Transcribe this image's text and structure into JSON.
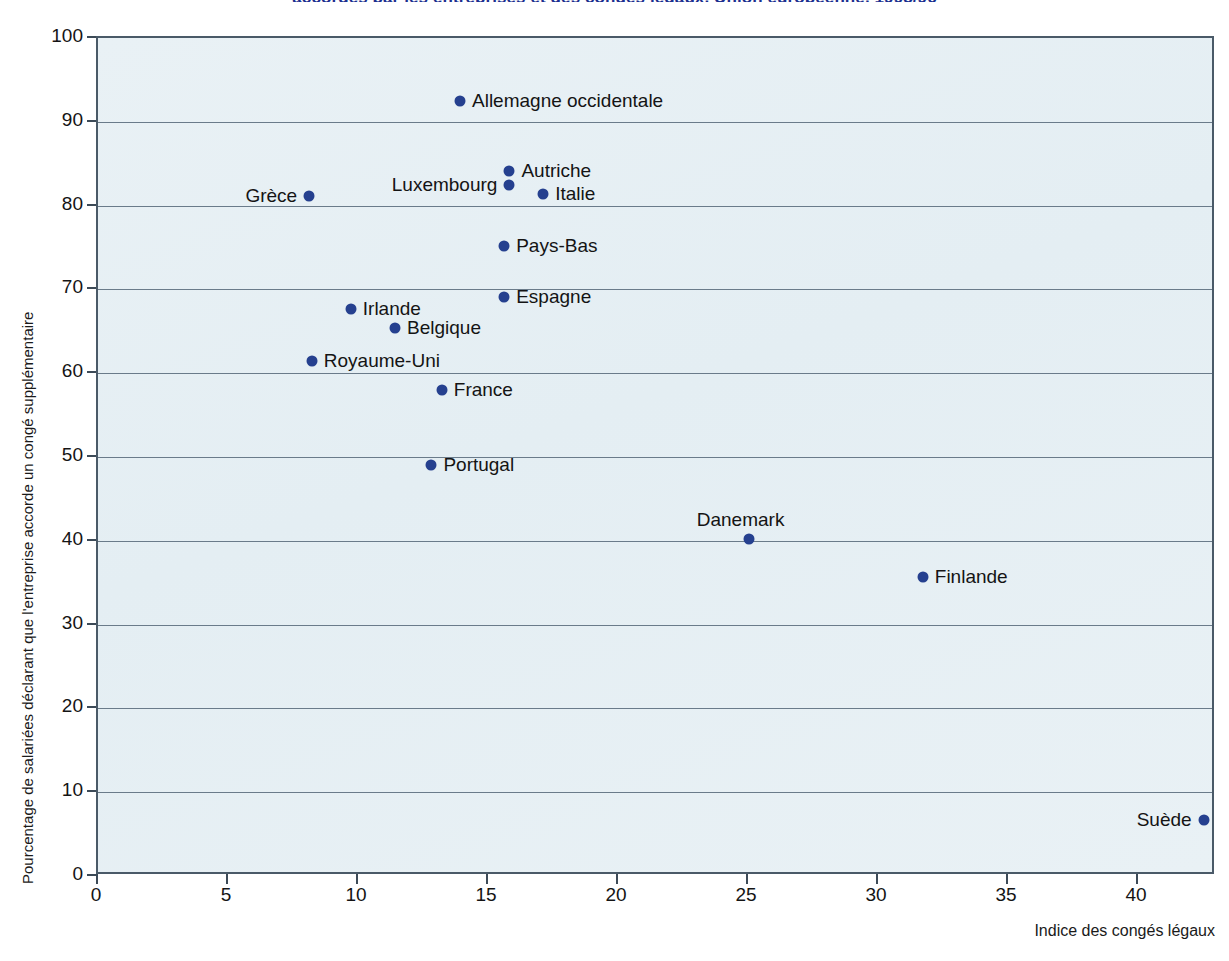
{
  "chart_data": {
    "type": "scatter",
    "title": "accordés par les entreprises et des congés légaux, Union européenne, 1995/96",
    "xlabel": "Indice des congés légaux",
    "ylabel": "Pourcentage de salariées déclarant que l'entreprise accorde un congé supplémentaire",
    "xlim": [
      0,
      43
    ],
    "ylim": [
      0,
      100
    ],
    "xticks": [
      0,
      5,
      10,
      15,
      20,
      25,
      30,
      35,
      40
    ],
    "yticks": [
      0,
      10,
      20,
      30,
      40,
      50,
      60,
      70,
      80,
      90,
      100
    ],
    "grid": "horizontal",
    "legend": "none",
    "marker_color": "#25408f",
    "plot_background": "#e8f0f4",
    "points": [
      {
        "label": "Allemagne occidentale",
        "x": 14.0,
        "y": 92.2,
        "label_side": "right"
      },
      {
        "label": "Autriche",
        "x": 15.9,
        "y": 83.9,
        "label_side": "right"
      },
      {
        "label": "Luxembourg",
        "x": 15.9,
        "y": 82.2,
        "label_side": "left"
      },
      {
        "label": "Italie",
        "x": 17.2,
        "y": 81.1,
        "label_side": "right"
      },
      {
        "label": "Grèce",
        "x": 8.2,
        "y": 80.9,
        "label_side": "left"
      },
      {
        "label": "Pays-Bas",
        "x": 15.7,
        "y": 75.0,
        "label_side": "right"
      },
      {
        "label": "Espagne",
        "x": 15.7,
        "y": 68.9,
        "label_side": "right"
      },
      {
        "label": "Irlande",
        "x": 9.8,
        "y": 67.4,
        "label_side": "right"
      },
      {
        "label": "Belgique",
        "x": 11.5,
        "y": 65.1,
        "label_side": "right"
      },
      {
        "label": "Royaume-Uni",
        "x": 8.3,
        "y": 61.2,
        "label_side": "right"
      },
      {
        "label": "France",
        "x": 13.3,
        "y": 57.7,
        "label_side": "right"
      },
      {
        "label": "Portugal",
        "x": 12.9,
        "y": 48.8,
        "label_side": "right"
      },
      {
        "label": "Danemark",
        "x": 25.1,
        "y": 40.0,
        "label_side": "above"
      },
      {
        "label": "Finlande",
        "x": 31.8,
        "y": 35.5,
        "label_side": "right"
      },
      {
        "label": "Suède",
        "x": 42.6,
        "y": 6.4,
        "label_side": "left"
      }
    ]
  }
}
